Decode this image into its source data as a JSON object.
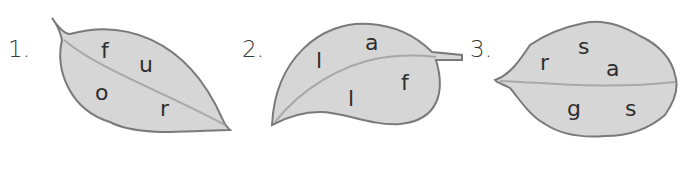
{
  "puzzles": [
    {
      "number": "1.",
      "letters": [
        "f",
        "u",
        "o",
        "r"
      ]
    },
    {
      "number": "2.",
      "letters": [
        "l",
        "a",
        "l",
        "f"
      ]
    },
    {
      "number": "3.",
      "letters": [
        "r",
        "s",
        "a",
        "g",
        "s"
      ]
    }
  ],
  "colors": {
    "leaf_fill": "#d6d6d6",
    "leaf_edge": "#7a7a7a",
    "vein": "#a8a8a8",
    "text": "#2e2e2e"
  }
}
